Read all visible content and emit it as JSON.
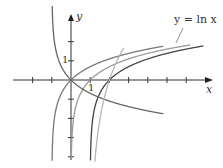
{
  "chart_data": {
    "type": "line",
    "title": "",
    "xlabel": "x",
    "ylabel": "y",
    "xlim": [
      -3,
      7.3
    ],
    "ylim": [
      -4.5,
      4
    ],
    "grid": false,
    "x_tick_spacing": 1,
    "y_tick_spacing": 1,
    "tick_labels": {
      "x": [
        "1"
      ],
      "y": [
        "1"
      ]
    },
    "annotations": [
      {
        "text": "y = ln x",
        "points_to": "ln x curve"
      }
    ],
    "series": [
      {
        "name": "y = ln x",
        "formula": "ln(x)",
        "color": "#9a9a9a"
      },
      {
        "name": "y = ln(x+1)",
        "formula": "ln(x+1)",
        "color": "#777777"
      },
      {
        "name": "y = ln(x-1)",
        "formula": "ln(x-1)",
        "color": "#444444"
      },
      {
        "name": "y = -ln(x+1)",
        "formula": "-ln(x+1)",
        "color": "#666666"
      },
      {
        "name": "y = 3ln(x-1)",
        "formula": "3*ln(x-1)",
        "color": "#b5b5b5"
      }
    ]
  },
  "labels": {
    "x_axis": "x",
    "y_axis": "y",
    "x_tick_1": "1",
    "y_tick_1": "1",
    "curve_label": "y = ln x"
  }
}
